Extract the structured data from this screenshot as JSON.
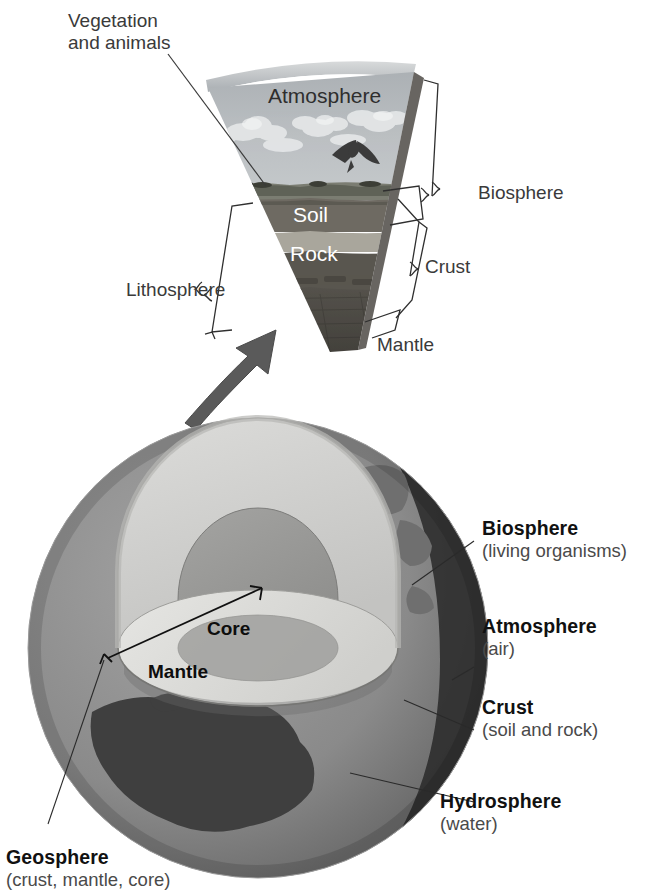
{
  "figure": {
    "background_color": "#ffffff"
  },
  "callouts": {
    "vegetation_line1": "Vegetation",
    "vegetation_line2": "and animals",
    "lithosphere": "Lithosphere",
    "biosphere_wedge": "Biosphere",
    "crust_wedge": "Crust",
    "mantle_wedge": "Mantle"
  },
  "wedge": {
    "layers": [
      {
        "name": "Atmosphere",
        "label": "Atmosphere",
        "text_color": "#2e2e2e",
        "fill": "#b9bdc0"
      },
      {
        "name": "Soil",
        "label": "Soil",
        "text_color": "#ffffff",
        "fill": "#6e6a62"
      },
      {
        "name": "Rock",
        "label": "Rock",
        "text_color": "#ffffff",
        "fill": "#5d5a55"
      }
    ]
  },
  "earth": {
    "interior_labels": [
      {
        "name": "Core",
        "label": "Core"
      },
      {
        "name": "Mantle",
        "label": "Mantle"
      }
    ],
    "spheres": [
      {
        "name": "biosphere",
        "title": "Biosphere",
        "subtitle": "(living organisms)"
      },
      {
        "name": "atmosphere",
        "title": "Atmosphere",
        "subtitle": "(air)"
      },
      {
        "name": "crust",
        "title": "Crust",
        "subtitle": "(soil and rock)"
      },
      {
        "name": "hydrosphere",
        "title": "Hydrosphere",
        "subtitle": "(water)"
      },
      {
        "name": "geosphere",
        "title": "Geosphere",
        "subtitle": "(crust, mantle, core)"
      }
    ]
  },
  "colors": {
    "mantle_fill": "#d2d2d0",
    "core_fill": "#969694",
    "ocean_fill": "#8e8e8e",
    "land_fill": "#4a4a4a",
    "dark_ocean_fill": "#2e2e2e",
    "wedge_sky": "#b9bdc0",
    "wedge_soil": "#6e6a62",
    "wedge_rock": "#59564f",
    "wedge_mantle": "#4d4a44",
    "line_color": "#3a3a3a",
    "text_dark": "#111111",
    "text_gray": "#4a4a4a"
  }
}
